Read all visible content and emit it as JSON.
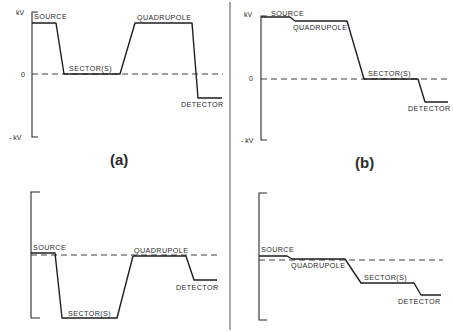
{
  "figure": {
    "divider_x": 230,
    "panels": [
      {
        "id": "a",
        "tag": "(a)",
        "axis_labels": {
          "top": "kV",
          "zero": "0",
          "bottom": "- kV"
        },
        "stages": [
          "SOURCE",
          "SECTOR(S)",
          "QUADRUPOLE",
          "DETECTOR"
        ],
        "labels": {
          "source": "SOURCE",
          "sectors": "SECTOR(S)",
          "quadrupole": "QUADRUPOLE",
          "detector": "DETECTOR"
        }
      },
      {
        "id": "b",
        "tag": "(b)",
        "axis_labels": {
          "top": "kV",
          "zero": "0",
          "bottom": "- kV"
        },
        "stages": [
          "SOURCE",
          "QUADRUPOLE",
          "SECTOR(S)",
          "DETECTOR"
        ],
        "labels": {
          "source": "SOURCE",
          "quadrupole": "QUADRUPOLE",
          "sectors": "SECTOR(S)",
          "detector": "DETECTOR"
        }
      },
      {
        "id": "c",
        "stages": [
          "SOURCE",
          "SECTOR(S)",
          "QUADRUPOLE",
          "DETECTOR"
        ],
        "labels": {
          "source": "SOURCE",
          "sectors": "SECTOR(S)",
          "quadrupole": "QUADRUPOLE",
          "detector": "DETECTOR"
        }
      },
      {
        "id": "d",
        "stages": [
          "SOURCE",
          "QUADRUPOLE",
          "SECTOR(S)",
          "DETECTOR"
        ],
        "labels": {
          "source": "SOURCE",
          "quadrupole": "QUADRUPOLE",
          "sectors": "SECTOR(S)",
          "detector": "DETECTOR"
        }
      }
    ]
  }
}
